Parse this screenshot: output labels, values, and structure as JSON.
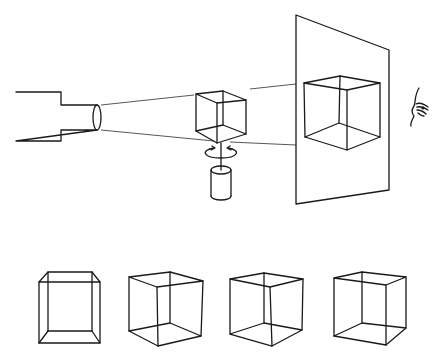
{
  "figure": {
    "colors": {
      "line": "#1a1a1a",
      "ray": "#444444",
      "background": "#ffffff"
    },
    "top_scene": {
      "projector": {
        "body": [
          16,
          92,
          61,
          141
        ],
        "barrel": [
          61,
          105,
          97,
          130
        ],
        "lens": {
          "cx": 97,
          "cy": 117,
          "rx": 4,
          "ry": 13
        }
      },
      "object_cube": "rotating wire cube on a stand",
      "rotation_arrow": "circular arrow around vertical axis",
      "stand": "cylinder",
      "screen": "translucent screen with projected cube shadow",
      "observer": "eye-icon"
    },
    "bottom_row": {
      "cubes": [
        "projection-1",
        "projection-2",
        "projection-3",
        "projection-4"
      ]
    },
    "caption": {
      "text": "",
      "note": "truncated caption at bottom edge, illegible"
    }
  }
}
